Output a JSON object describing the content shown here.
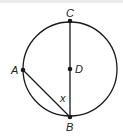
{
  "diagram": {
    "type": "circle-geometry",
    "circle": {
      "center": "D",
      "cx": 70,
      "cy": 69,
      "r": 47
    },
    "points": [
      {
        "id": "C",
        "label": "C",
        "x": 70,
        "y": 21,
        "lx": 66,
        "ly": 17
      },
      {
        "id": "D",
        "label": "D",
        "x": 70,
        "y": 69,
        "lx": 75,
        "ly": 73
      },
      {
        "id": "A",
        "label": "A",
        "x": 23,
        "y": 70,
        "lx": 11,
        "ly": 74
      },
      {
        "id": "B",
        "label": "B",
        "x": 70,
        "y": 117,
        "lx": 66,
        "ly": 131
      }
    ],
    "segments": [
      {
        "from": "C",
        "to": "B",
        "name": "diameter-CB"
      },
      {
        "from": "A",
        "to": "B",
        "name": "chord-AB"
      }
    ],
    "angle_label": {
      "text": "x",
      "x": 60,
      "y": 102
    },
    "colors": {
      "stroke": "#1a1a1a",
      "top_band": "#ececec"
    }
  }
}
